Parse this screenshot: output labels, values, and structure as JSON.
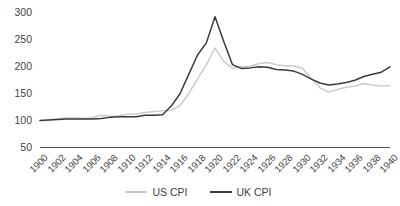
{
  "chart_data": {
    "type": "line",
    "title": "",
    "subtitle": "",
    "xlabel": "",
    "ylabel": "",
    "ylim": [
      50,
      300
    ],
    "xlim": [
      1900,
      1940
    ],
    "yticks": [
      300,
      250,
      200,
      150,
      100,
      50
    ],
    "grid": false,
    "legend_position": "bottom",
    "x": [
      1900,
      1901,
      1902,
      1903,
      1904,
      1905,
      1906,
      1907,
      1908,
      1909,
      1910,
      1911,
      1912,
      1913,
      1914,
      1915,
      1916,
      1917,
      1918,
      1919,
      1920,
      1921,
      1922,
      1923,
      1924,
      1925,
      1926,
      1927,
      1928,
      1929,
      1930,
      1931,
      1932,
      1933,
      1934,
      1935,
      1936,
      1937,
      1938,
      1939,
      1940
    ],
    "xticks": [
      "1900",
      "1902",
      "1904",
      "1906",
      "1908",
      "1910",
      "1912",
      "1914",
      "1916",
      "1918",
      "1920",
      "1922",
      "1924",
      "1926",
      "1928",
      "1930",
      "1932",
      "1934",
      "1936",
      "1938",
      "1940"
    ],
    "series": [
      {
        "name": "US CPI",
        "color": "#c8c8c8",
        "values": [
          100,
          101,
          103,
          105,
          105,
          104,
          106,
          110,
          108,
          108,
          112,
          112,
          115,
          117,
          118,
          119,
          128,
          150,
          177,
          203,
          235,
          210,
          197,
          200,
          201,
          206,
          208,
          204,
          202,
          202,
          197,
          179,
          161,
          153,
          158,
          162,
          164,
          169,
          166,
          164,
          165
        ],
        "label_values": {
          "1900": 100,
          "1920": 235,
          "1921": 210,
          "1933": 153,
          "1940": 165
        }
      },
      {
        "name": "UK CPI",
        "color": "#3a3a3a",
        "values": [
          100,
          101,
          102,
          103,
          103,
          103,
          103,
          104,
          106,
          107,
          107,
          107,
          110,
          110,
          111,
          127,
          150,
          186,
          222,
          244,
          293,
          247,
          204,
          197,
          198,
          200,
          199,
          195,
          194,
          192,
          186,
          177,
          170,
          166,
          168,
          171,
          175,
          182,
          186,
          190,
          200
        ],
        "label_values": {
          "1900": 100,
          "1920": 293,
          "1922": 204,
          "1933": 166,
          "1940": 200
        }
      }
    ]
  },
  "legend": {
    "items": [
      {
        "label": "US CPI"
      },
      {
        "label": "UK CPI"
      }
    ]
  },
  "axis": {
    "axis_line_color": "#595959",
    "tick_label_color": "#3f3f3f"
  }
}
